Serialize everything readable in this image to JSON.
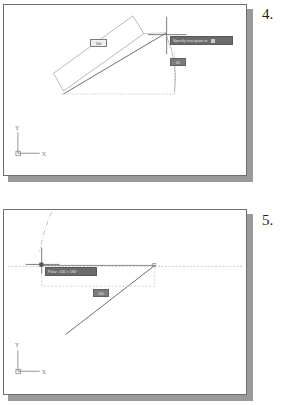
{
  "document": {
    "kind": "cad-tutorial-figure-pair",
    "background_color": "#ffffff"
  },
  "figures": [
    {
      "id": "fig4",
      "step_number": "4.",
      "panel": {
        "border_color": "#6f6f6f",
        "shadow_color": "#9a9a9a",
        "background": "#ffffff"
      },
      "ucs_icon": {
        "x_label": "X",
        "y_label": "Y"
      },
      "cursor": {
        "type": "crosshair",
        "x": 164,
        "y": 30
      },
      "tooltip": {
        "text": "Specify next point or",
        "has_dropdown_caret": true,
        "background": "#6b6b6b",
        "text_color": "#e8e8e8"
      },
      "value_boxes": [
        {
          "name": "length",
          "text": "100",
          "style": "light"
        },
        {
          "name": "angle",
          "text": "45",
          "style": "dark"
        }
      ],
      "geometry": {
        "rectangle_outline": "rotated rectangle",
        "solid_line": "diagonal from lower-left to cursor",
        "dotted_tracking": "horizontal baseline and arc"
      }
    },
    {
      "id": "fig5",
      "step_number": "5.",
      "panel": {
        "border_color": "#6f6f6f",
        "shadow_color": "#9a9a9a",
        "background": "#ffffff"
      },
      "ucs_icon": {
        "x_label": "X",
        "y_label": "Y"
      },
      "cursor": {
        "type": "crosshair",
        "x": 40,
        "y": 57
      },
      "tooltip": {
        "text": "Polar: 100 < 180°",
        "has_dropdown_caret": false,
        "background": "#6b6b6b",
        "text_color": "#e8e8e8"
      },
      "value_boxes": [
        {
          "name": "length",
          "text": "100",
          "style": "dark"
        }
      ],
      "geometry": {
        "solid_line": "diagonal from lower-left to upper-right vertex",
        "dashed_tracking": "horizontal polar tracking line",
        "dash_dot_curve": "arc entering from top",
        "dashed_rectangle": "rubber-band bounding box"
      }
    }
  ],
  "colors": {
    "ink": "#1d1d1d",
    "line_geometry": "#8d8d8d",
    "line_solid": "#5a5a5a",
    "tracking_dash": "#b5b5b5",
    "tooltip_bg": "#6b6b6b",
    "panel_shadow": "#9a9a9a"
  }
}
